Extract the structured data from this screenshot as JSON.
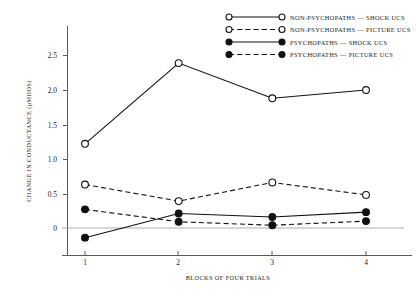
{
  "chart_data": {
    "type": "line",
    "title": "",
    "xlabel": "BLOCKS OF FOUR TRIALS",
    "ylabel": "CHANGE IN CONDUCTANCE (μMHOS)",
    "categories": [
      "1",
      "2",
      "3",
      "4"
    ],
    "x": [
      1,
      2,
      3,
      4
    ],
    "xlim": [
      0.55,
      4.45
    ],
    "ylim": [
      -0.38,
      2.78
    ],
    "yticks": [
      0,
      0.5,
      1.0,
      1.5,
      2.0,
      2.5
    ],
    "ytick_labels": [
      "0",
      "0.5",
      "1.0",
      "1.5",
      "2.0",
      "2.5"
    ],
    "xtick_labels": [
      "1",
      "2",
      "3",
      "4"
    ],
    "grid": false,
    "zero_reference_line": 0,
    "legend_position": "top-right",
    "series": [
      {
        "name": "NON-PSYCHOPATHS — SHOCK UCS",
        "values": [
          1.22,
          2.39,
          1.88,
          2.0
        ],
        "marker": "open-circle",
        "line_style": "solid"
      },
      {
        "name": "NON-PSYCHOPATHS — PICTURE UCS",
        "values": [
          0.63,
          0.39,
          0.66,
          0.48
        ],
        "marker": "open-circle",
        "line_style": "dashed"
      },
      {
        "name": "PSYCHOPATHS — SHOCK UCS",
        "values": [
          -0.14,
          0.21,
          0.16,
          0.23
        ],
        "marker": "filled-circle",
        "line_style": "solid"
      },
      {
        "name": "PSYCHOPATHS — PICTURE UCS",
        "values": [
          0.27,
          0.09,
          0.04,
          0.1
        ],
        "marker": "filled-circle",
        "line_style": "dashed"
      }
    ]
  },
  "legend": {
    "items": [
      "NON-PSYCHOPATHS — SHOCK UCS",
      "NON-PSYCHOPATHS — PICTURE UCS",
      "PSYCHOPATHS — SHOCK UCS",
      "PSYCHOPATHS — PICTURE UCS"
    ]
  },
  "axes": {
    "y_title": "CHANGE IN CONDUCTANCE (μMHOS)",
    "x_title": "BLOCKS OF FOUR TRIALS",
    "y_tick_labels": [
      "2.5",
      "2.0",
      "1.5",
      "1.0",
      "0.5",
      "0"
    ],
    "x_tick_labels": [
      "1",
      "2",
      "3",
      "4"
    ]
  },
  "colors": {
    "ink": "#111111",
    "axis": "#5a5a5a",
    "zero_line": "#9a9a9a",
    "background": "#ffffff"
  }
}
